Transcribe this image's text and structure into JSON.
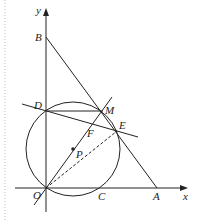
{
  "diagram": {
    "type": "geometry-figure",
    "colors": {
      "stroke": "#222222",
      "margin_dots": "#bbbbbb",
      "background": "#ffffff"
    },
    "axes": {
      "x_label": "x",
      "y_label": "y"
    },
    "points": {
      "O": {
        "label": "O",
        "x": 46,
        "y": 188
      },
      "A": {
        "label": "A",
        "x": 157,
        "y": 188
      },
      "B": {
        "label": "B",
        "x": 46,
        "y": 37
      },
      "C": {
        "label": "C",
        "x": 102,
        "y": 188
      },
      "D": {
        "label": "D",
        "x": 46,
        "y": 111
      },
      "E": {
        "label": "E",
        "x": 117,
        "y": 131
      },
      "F": {
        "label": "F",
        "x": 91,
        "y": 125
      },
      "M": {
        "label": "M",
        "x": 103,
        "y": 110
      },
      "P": {
        "label": "P",
        "x": 73,
        "y": 149
      }
    },
    "circle": {
      "center": "P",
      "radius": 47
    },
    "segments": [
      {
        "name": "BA",
        "style": "solid"
      },
      {
        "name": "DE-extended",
        "style": "solid"
      },
      {
        "name": "DM",
        "style": "solid"
      },
      {
        "name": "OM-extended",
        "style": "solid"
      },
      {
        "name": "OE",
        "style": "dashed"
      }
    ]
  }
}
